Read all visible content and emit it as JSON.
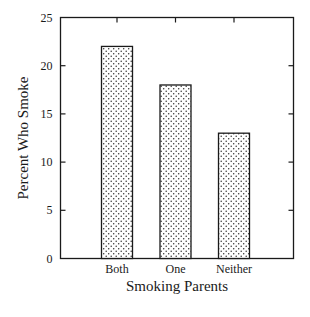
{
  "chart_data": {
    "type": "bar",
    "title": "",
    "xlabel": "Smoking Parents",
    "ylabel": "Percent Who Smoke",
    "categories": [
      "Both",
      "One",
      "Neither"
    ],
    "values": [
      22,
      18,
      13
    ],
    "ylim": [
      0,
      25
    ],
    "yticks": [
      0,
      5,
      10,
      15,
      20,
      25
    ],
    "grid": false,
    "legend": null,
    "bar_fill": "dotted stipple pattern",
    "colors": {
      "bar_outline": "#1a1a1a",
      "dots": "#333333",
      "background": "#ffffff"
    }
  }
}
